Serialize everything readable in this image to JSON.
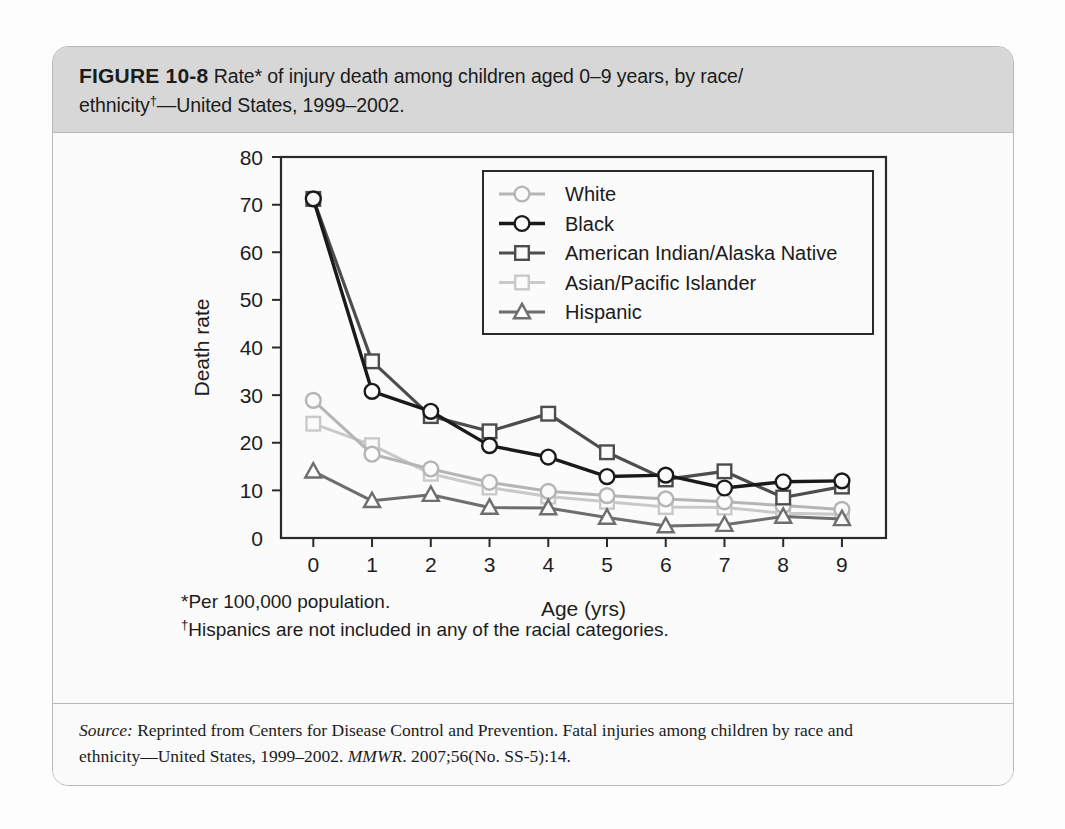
{
  "figure": {
    "label": "FIGURE 10-8",
    "caption_line1": "Rate* of injury death among children aged 0–9 years, by race/",
    "caption_line2_pre": "ethnicity",
    "caption_line2_sup": "†",
    "caption_line2_post": "—United States, 1999–2002."
  },
  "footnotes": {
    "star": "*Per 100,000 population.",
    "dagger_sup": "†",
    "dagger_text": "Hispanics are not included in any of the racial categories."
  },
  "source": {
    "label": "Source:",
    "line1_rest": " Reprinted from Centers for Disease Control and Prevention. Fatal injuries among children by race and",
    "line2_pre": "ethnicity—United States, 1999–2002. ",
    "line2_italic": "MMWR",
    "line2_post": ". 2007;56(No. SS-5):14."
  },
  "chart_data": {
    "type": "line",
    "title": "",
    "xlabel": "Age (yrs)",
    "ylabel": "Death rate",
    "x": [
      0,
      1,
      2,
      3,
      4,
      5,
      6,
      7,
      8,
      9
    ],
    "xtick_labels": [
      "0",
      "1",
      "2",
      "3",
      "4",
      "5",
      "6",
      "7",
      "8",
      "9"
    ],
    "ytick_labels": [
      "0",
      "10",
      "20",
      "30",
      "40",
      "50",
      "60",
      "70",
      "80"
    ],
    "yticks": [
      0,
      10,
      20,
      30,
      40,
      50,
      60,
      70,
      80
    ],
    "xlim": [
      -0.55,
      9.75
    ],
    "ylim": [
      0,
      80
    ],
    "grid": false,
    "legend_position": "upper-center-right",
    "series": [
      {
        "name": "White",
        "color": "#b5b5b5",
        "marker": "circle",
        "line_width": 3.0,
        "values": [
          28.9,
          17.6,
          14.5,
          11.7,
          9.8,
          8.9,
          8.2,
          7.6,
          6.8,
          6.0
        ]
      },
      {
        "name": "Black",
        "color": "#1a1a1a",
        "marker": "circle",
        "line_width": 3.4,
        "values": [
          71.2,
          30.8,
          26.6,
          19.4,
          17.0,
          12.9,
          13.2,
          10.5,
          11.8,
          12.0
        ]
      },
      {
        "name": "American Indian/Alaska Native",
        "color": "#4d4d4d",
        "marker": "square",
        "line_width": 3.2,
        "values": [
          71.2,
          37.1,
          25.6,
          22.4,
          26.1,
          18.0,
          12.3,
          14.0,
          8.5,
          10.8
        ]
      },
      {
        "name": "Asian/Pacific Islander",
        "color": "#c9c9c9",
        "marker": "square",
        "line_width": 3.0,
        "values": [
          24.0,
          19.5,
          13.5,
          10.6,
          8.7,
          7.6,
          6.5,
          6.4,
          5.2,
          5.0
        ]
      },
      {
        "name": "Hispanic",
        "color": "#6e6e6e",
        "marker": "triangle",
        "line_width": 3.0,
        "values": [
          14.0,
          7.8,
          9.1,
          6.4,
          6.3,
          4.3,
          2.5,
          2.8,
          4.5,
          4.0
        ]
      }
    ]
  }
}
